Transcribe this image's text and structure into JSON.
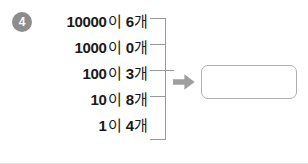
{
  "problem": {
    "number": "4",
    "lines": [
      {
        "place": "10000",
        "particle": "이",
        "count": "6",
        "unit": "개"
      },
      {
        "place": "1000",
        "particle": "이",
        "count": "0",
        "unit": "개"
      },
      {
        "place": "100",
        "particle": "이",
        "count": "3",
        "unit": "개"
      },
      {
        "place": "10",
        "particle": "이",
        "count": "8",
        "unit": "개"
      },
      {
        "place": "1",
        "particle": "이",
        "count": "4",
        "unit": "개"
      }
    ],
    "answer_value": "",
    "answer_placeholder": ""
  },
  "icons": {
    "arrow": "right-arrow-icon",
    "bracket": "grouping-bracket"
  },
  "colors": {
    "number_badge": "#8d8d8d",
    "text": "#1a1a1a",
    "bracket": "#9a9a9a",
    "arrow": "#9e9e9e",
    "answer_border": "#b0b0b0",
    "page_background": "#ffffff"
  }
}
